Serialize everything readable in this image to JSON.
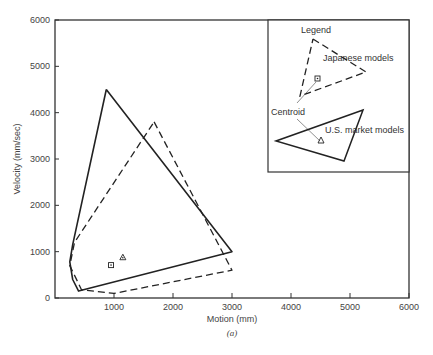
{
  "chart_data": {
    "type": "line",
    "title": "",
    "caption": "(a)",
    "xlabel": "Motion (mm)",
    "ylabel": "Velocity (mm/sec)",
    "xlim": [
      0,
      6000
    ],
    "ylim": [
      0,
      6000
    ],
    "x_ticks": [
      1000,
      2000,
      3000,
      4000,
      5000,
      6000
    ],
    "y_ticks": [
      0,
      1000,
      2000,
      3000,
      4000,
      5000,
      6000
    ],
    "x_tick_labels": [
      "1000",
      "2000",
      "3000",
      "4000",
      "5000",
      "6000"
    ],
    "y_tick_labels": [
      "0",
      "1000",
      "2000",
      "3000",
      "4000",
      "5000",
      "6000"
    ],
    "grid": false,
    "legend_position": "upper right (inset box)",
    "series": [
      {
        "name": "U.S. market models",
        "style": "solid",
        "polygon": [
          [
            870,
            4500
          ],
          [
            3000,
            1000
          ],
          [
            400,
            150
          ],
          [
            300,
            400
          ],
          [
            250,
            780
          ],
          [
            300,
            1150
          ],
          [
            870,
            4500
          ]
        ],
        "centroid": {
          "marker": "triangle",
          "x": 1150,
          "y": 880
        }
      },
      {
        "name": "Japanese models",
        "style": "dashed",
        "polygon": [
          [
            1680,
            3800
          ],
          [
            3000,
            600
          ],
          [
            1000,
            100
          ],
          [
            450,
            180
          ],
          [
            250,
            700
          ],
          [
            330,
            1200
          ],
          [
            1680,
            3800
          ]
        ],
        "centroid": {
          "marker": "square",
          "x": 950,
          "y": 710
        }
      }
    ]
  },
  "legend": {
    "title": "Legend",
    "japanese_label": "Japanese models",
    "us_label": "U.S. market models",
    "centroid_label": "Centroid"
  }
}
